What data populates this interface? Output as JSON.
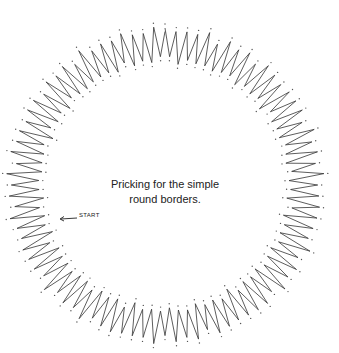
{
  "caption": {
    "line1": "Pricking for the simple",
    "line2": "round borders."
  },
  "start_marker": {
    "label": "START",
    "icon": "arrow-left-icon"
  },
  "pattern": {
    "center": [
      165,
      185
    ],
    "outer_radius": 155,
    "inner_radius": 121,
    "points": 88,
    "stroke": "#333333",
    "dot_color": "#555555"
  }
}
